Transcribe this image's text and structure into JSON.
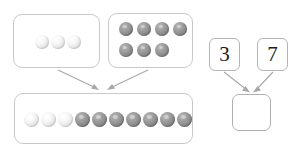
{
  "scene": {
    "type": "part-part-whole-addition-model",
    "background_color": "#ffffff",
    "counter_light_color": "#ececec",
    "counter_dark_color": "#8f8f8f",
    "box_border_color": "#c9c9c9",
    "arrow_color": "#a8a8a8"
  },
  "pictorial_model": {
    "part_one_box": {
      "label": "",
      "counter_count": 3,
      "counter_color": "light",
      "counters": [
        {
          "color": "light"
        },
        {
          "color": "light"
        },
        {
          "color": "light"
        }
      ]
    },
    "part_two_box": {
      "label": "",
      "counter_count": 7,
      "counter_color": "dark",
      "rows": [
        4,
        3
      ],
      "counters": [
        {
          "color": "dark"
        },
        {
          "color": "dark"
        },
        {
          "color": "dark"
        },
        {
          "color": "dark"
        },
        {
          "color": "dark"
        },
        {
          "color": "dark"
        },
        {
          "color": "dark"
        }
      ]
    },
    "whole_box": {
      "label": "",
      "counter_count": 10,
      "counters": [
        {
          "color": "light"
        },
        {
          "color": "light"
        },
        {
          "color": "light"
        },
        {
          "color": "dark"
        },
        {
          "color": "dark"
        },
        {
          "color": "dark"
        },
        {
          "color": "dark"
        },
        {
          "color": "dark"
        },
        {
          "color": "dark"
        },
        {
          "color": "dark"
        }
      ]
    }
  },
  "numeric_model": {
    "addend_one": "3",
    "addend_two": "7",
    "sum_box_value": ""
  }
}
